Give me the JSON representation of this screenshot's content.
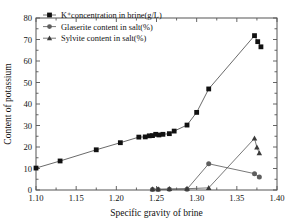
{
  "chart_data": {
    "type": "line",
    "title": "",
    "subtitle": "",
    "xlabel": "Specific gravity of brine",
    "ylabel": "Content of potassium",
    "xlim": [
      1.1,
      1.4
    ],
    "ylim": [
      0,
      80
    ],
    "xticks": [
      "1.10",
      "1.15",
      "1.20",
      "1.25",
      "1.30",
      "1.35",
      "1.40"
    ],
    "xtick_values": [
      1.1,
      1.15,
      1.2,
      1.25,
      1.3,
      1.35,
      1.4
    ],
    "yticks": [
      "0",
      "10",
      "20",
      "30",
      "40",
      "50",
      "60",
      "70",
      "80"
    ],
    "ytick_values": [
      0,
      10,
      20,
      30,
      40,
      50,
      60,
      70,
      80
    ],
    "grid": false,
    "legend_position": "top-left",
    "series": [
      {
        "name": "K⁺concentration in brine(g/L)",
        "marker": "square",
        "color": "#111111",
        "x": [
          1.1,
          1.13,
          1.175,
          1.205,
          1.228,
          1.236,
          1.241,
          1.245,
          1.249,
          1.253,
          1.258,
          1.266,
          1.272,
          1.288,
          1.3,
          1.315,
          1.372,
          1.376,
          1.38
        ],
        "y": [
          10.2,
          13.5,
          18.7,
          22.0,
          24.6,
          24.7,
          25.2,
          25.3,
          25.9,
          25.6,
          25.9,
          26.2,
          27.4,
          30.2,
          36.1,
          47.0,
          71.8,
          69.0,
          66.6
        ]
      },
      {
        "name": "Glaserite content in salt(%)",
        "marker": "circle",
        "color": "#5e5e5e",
        "x": [
          1.245,
          1.252,
          1.266,
          1.288,
          1.315,
          1.372,
          1.378
        ],
        "y": [
          0.2,
          0.2,
          0.3,
          0.4,
          12.2,
          7.6,
          6.1
        ]
      },
      {
        "name": "Sylvite content in salt(%)",
        "marker": "triangle",
        "color": "#3a3a3a",
        "x": [
          1.245,
          1.252,
          1.266,
          1.288,
          1.315,
          1.372,
          1.375,
          1.378
        ],
        "y": [
          0.4,
          0.4,
          0.5,
          0.6,
          1.0,
          24.0,
          19.8,
          17.2
        ]
      }
    ]
  },
  "legend": {
    "items": [
      {
        "label": "K⁺concentration in brine(g/L)",
        "marker": "square"
      },
      {
        "label": "Glaserite content in salt(%)",
        "marker": "circle"
      },
      {
        "label": "Sylvite content in salt(%)",
        "marker": "triangle"
      }
    ]
  },
  "axes": {
    "x_title": "Specific gravity of brine",
    "y_title": "Content of potassium"
  }
}
